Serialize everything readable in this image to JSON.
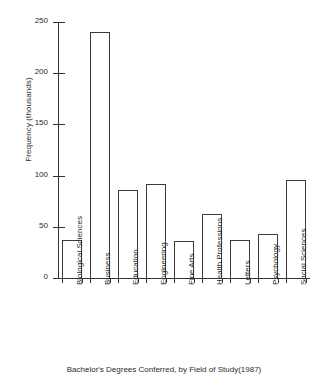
{
  "chart_data": {
    "type": "bar",
    "title": "",
    "caption": "Bachelor's Degrees Conferred, by Field of Study(1987)",
    "xlabel": "",
    "ylabel": "Frequency (thousands)",
    "ylim": [
      0,
      250
    ],
    "yticks": [
      0,
      50,
      100,
      150,
      200,
      250
    ],
    "ytick_labels": [
      "0",
      "50",
      "100",
      "150",
      "200",
      "250"
    ],
    "grid": false,
    "legend": false,
    "categories": [
      "Biological Sciences",
      "Business",
      "Education",
      "Engineering",
      "Fine Arts",
      "Health Professions",
      "Letters",
      "Psychology",
      "Social Sciences"
    ],
    "values": [
      37,
      240,
      86,
      92,
      36,
      63,
      37,
      43,
      96
    ],
    "bar_facecolor": "#ffffff",
    "bar_edgecolor": "#3a3a3a",
    "axis_color": "#333333"
  }
}
